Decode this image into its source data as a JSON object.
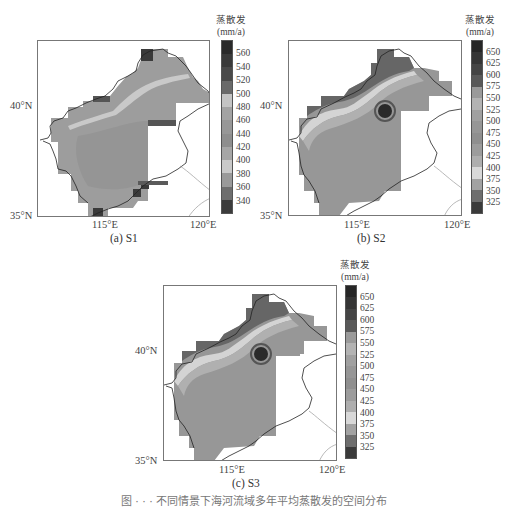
{
  "figure": {
    "caption_partial": "图 · · · 不同情景下海河流域多年平均蒸散发的空间分布"
  },
  "colorbar_title": {
    "line1": "蒸散发",
    "line2": "(mm/a)"
  },
  "axes": {
    "y_ticks": [
      "40°N",
      "35°N"
    ],
    "x_ticks": [
      "115°E",
      "120°E"
    ]
  },
  "chart_data": [
    {
      "type": "heatmap",
      "title": "(a) S1",
      "subject": "Multi-year mean evapotranspiration, Haihe River Basin",
      "xlabel": "Longitude",
      "ylabel": "Latitude",
      "xlim": [
        "~111.5°E",
        "120°E"
      ],
      "ylim": [
        "35°N",
        "~42.8°N"
      ],
      "x_tick_labels": [
        "115°E",
        "120°E"
      ],
      "y_tick_labels": [
        "35°N",
        "40°N"
      ],
      "colorbar": {
        "label": "蒸散发 (mm/a)",
        "ticks": [
          560,
          540,
          520,
          500,
          480,
          460,
          440,
          420,
          400,
          380,
          360,
          340
        ],
        "range": [
          320,
          580
        ]
      },
      "description": "Most of basin 420–460 mm/a; light band ~480–500 along northwestern mountains; dark patches (>520) at north tip, near Bohai coast and southern edge"
    },
    {
      "type": "heatmap",
      "title": "(b) S2",
      "subject": "Multi-year mean evapotranspiration, Haihe River Basin",
      "xlabel": "Longitude",
      "ylabel": "Latitude",
      "x_tick_labels": [
        "115°E",
        "120°E"
      ],
      "y_tick_labels": [
        "35°N",
        "40°N"
      ],
      "colorbar": {
        "label": "蒸散发 (mm/a)",
        "ticks": [
          650,
          625,
          600,
          575,
          550,
          525,
          500,
          475,
          450,
          425,
          400,
          375,
          350,
          325
        ],
        "range": [
          300,
          675
        ]
      },
      "description": "Plains mostly 450–500 mm/a; light band ~375–400 in northwest; hot spot >650 near Beijing/Tianjin (~117°E, 40°N)"
    },
    {
      "type": "heatmap",
      "title": "(c) S3",
      "subject": "Multi-year mean evapotranspiration, Haihe River Basin",
      "xlabel": "Longitude",
      "ylabel": "Latitude",
      "x_tick_labels": [
        "115°E",
        "120°E"
      ],
      "y_tick_labels": [
        "35°N",
        "40°N"
      ],
      "colorbar": {
        "label": "蒸散发 (mm/a)",
        "ticks": [
          650,
          625,
          600,
          575,
          550,
          525,
          500,
          475,
          450,
          425,
          400,
          375,
          350,
          325
        ],
        "range": [
          300,
          675
        ]
      },
      "description": "Similar to S2: plains 450–500 mm/a; light band in northwest; hot spot >650 near ~117°E, 40°N"
    }
  ],
  "panels": [
    {
      "caption": "(a) S1",
      "ticks": [
        "560",
        "540",
        "520",
        "500",
        "480",
        "460",
        "440",
        "420",
        "400",
        "380",
        "360",
        "340"
      ]
    },
    {
      "caption": "(b) S2",
      "ticks": [
        "650",
        "625",
        "600",
        "575",
        "550",
        "525",
        "500",
        "475",
        "450",
        "425",
        "400",
        "375",
        "350",
        "325"
      ]
    },
    {
      "caption": "(c) S3",
      "ticks": [
        "650",
        "625",
        "600",
        "575",
        "550",
        "525",
        "500",
        "475",
        "450",
        "425",
        "400",
        "375",
        "350",
        "325"
      ]
    }
  ],
  "colors": {
    "s1_bar": [
      "#2a2a2a",
      "#3a3a3a",
      "#4a4a4a",
      "#6a6a6a",
      "#c4c4c4",
      "#a3a3a3",
      "#979797",
      "#8e8e8e",
      "#a6a6a6",
      "#c9c9c9",
      "#9a9a9a",
      "#6e6e6e",
      "#3c3c3c"
    ],
    "s23_bar": [
      "#262626",
      "#353535",
      "#444444",
      "#595959",
      "#9a9a9a",
      "#b3b3b3",
      "#a0a0a0",
      "#969696",
      "#8f8f8f",
      "#9c9c9c",
      "#aeaeae",
      "#d8d8d8",
      "#a2a2a2",
      "#6e6e6e",
      "#3a3a3a"
    ],
    "basin_fill": "#9d9d9d",
    "light_band": "#c8c8c8",
    "dark": "#3a3a3a",
    "outline": "#222222"
  }
}
